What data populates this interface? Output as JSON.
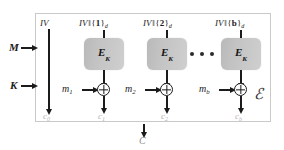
{
  "diagram": {
    "enclosure_label": "ℰ",
    "colors": {
      "line": "#1b1b1b",
      "cipher_box_fill": "#c3c3c3",
      "enclosure_border": "#c9c9c9",
      "output_label": "#b4b4b4"
    },
    "inputs": {
      "message_label": "M",
      "key_label": "K"
    },
    "iv_label": "IV",
    "final_output_label": "C",
    "ellipsis_dots": [
      "•",
      "•",
      "•"
    ],
    "iv_output_label": "c",
    "iv_output_subscript": "0",
    "blocks": [
      {
        "counter_prefix": "IV",
        "counter_sep": "‖",
        "counter_open": "{",
        "counter_index": "1",
        "counter_close": "}",
        "counter_subscript": "d",
        "cipher_label": "E",
        "cipher_subscript": "K",
        "message_block_label": "m",
        "message_block_subscript": "1",
        "output_label": "c",
        "output_subscript": "1"
      },
      {
        "counter_prefix": "IV",
        "counter_sep": "‖",
        "counter_open": "{",
        "counter_index": "2",
        "counter_close": "}",
        "counter_subscript": "d",
        "cipher_label": "E",
        "cipher_subscript": "K",
        "message_block_label": "m",
        "message_block_subscript": "2",
        "output_label": "c",
        "output_subscript": "2"
      },
      {
        "counter_prefix": "IV",
        "counter_sep": "‖",
        "counter_open": "{",
        "counter_index": "b",
        "counter_close": "}",
        "counter_subscript": "d",
        "cipher_label": "E",
        "cipher_subscript": "K",
        "message_block_label": "m",
        "message_block_subscript": "b",
        "output_label": "c",
        "output_subscript": "b"
      }
    ]
  }
}
